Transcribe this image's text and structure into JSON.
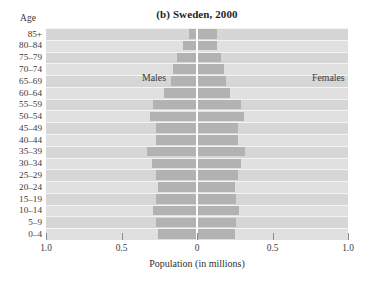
{
  "figure": {
    "title": "(b) Sweden, 2000",
    "age_axis_header": "Age",
    "xlabel": "Population (in millions)",
    "males_label": "Males",
    "females_label": "Females"
  },
  "colors": {
    "bar": "#b2b2b2",
    "band_odd": "#d6d6d6",
    "band_even": "#e0e0e0",
    "zero_line": "#ffffff",
    "text": "#3a3a3a"
  },
  "axis": {
    "x_tick_labels": [
      "1.0",
      "0.5",
      "0",
      "0.5",
      "1.0"
    ],
    "x_tick_values": [
      -1.0,
      -0.5,
      0,
      0.5,
      1.0
    ],
    "x_min": -1.0,
    "x_max": 1.0
  },
  "chart_data": {
    "type": "bar",
    "subtype": "population-pyramid",
    "title": "(b) Sweden, 2000",
    "xlabel": "Population (in millions)",
    "ylabel": "Age",
    "xlim": [
      -1.0,
      1.0
    ],
    "grid": false,
    "legend_position": "in-plot",
    "categories": [
      "85+",
      "80–84",
      "75–79",
      "70–74",
      "65–69",
      "60–64",
      "55–59",
      "50–54",
      "45–49",
      "40–44",
      "35–39",
      "30–34",
      "25–29",
      "20–24",
      "15–19",
      "10–14",
      "5–9",
      "0–4"
    ],
    "series": [
      {
        "name": "Males",
        "direction": "left",
        "values": [
          0.05,
          0.09,
          0.13,
          0.16,
          0.17,
          0.22,
          0.29,
          0.31,
          0.27,
          0.27,
          0.33,
          0.3,
          0.27,
          0.26,
          0.27,
          0.29,
          0.27,
          0.26
        ]
      },
      {
        "name": "Females",
        "direction": "right",
        "values": [
          0.13,
          0.13,
          0.16,
          0.18,
          0.19,
          0.22,
          0.29,
          0.31,
          0.27,
          0.27,
          0.32,
          0.29,
          0.27,
          0.25,
          0.26,
          0.28,
          0.26,
          0.25
        ]
      }
    ]
  }
}
